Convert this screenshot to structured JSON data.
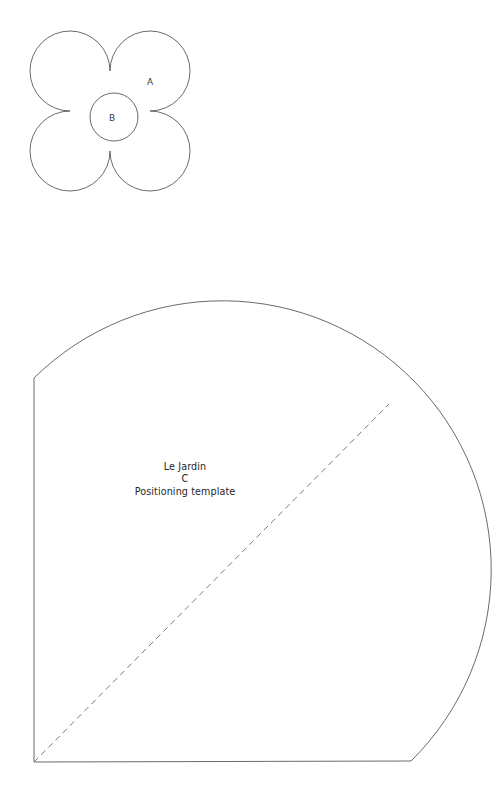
{
  "document": {
    "kind": "sewing-pattern-template",
    "background_color": "#ffffff",
    "line_color": "#595959",
    "dashed_line_color": "#6a6a6a",
    "text_color": "#262626",
    "width": 498,
    "height": 798
  },
  "flower_piece": {
    "name": "quatrefoil-flower-piece",
    "outer_label": "A",
    "inner_label": "B",
    "bounds": {
      "x": 28,
      "y": 33,
      "width": 164,
      "height": 157
    },
    "inner_circle": {
      "cx": 114,
      "cy": 117,
      "r": 24
    }
  },
  "template_piece": {
    "name": "positioning-template-piece",
    "caption": {
      "line1": "Le Jardin",
      "line2": "C",
      "line3": "Positioning template"
    },
    "caption_position": {
      "x": 185,
      "y": 461
    },
    "corner_bottom_left": {
      "x": 34,
      "y": 762
    },
    "corner_bottom_right": {
      "x": 411,
      "y": 761
    },
    "corner_top_left": {
      "x": 34,
      "y": 378
    },
    "arc_top": {
      "x": 215,
      "y": 320
    },
    "arc_right": {
      "x": 472,
      "y": 566
    },
    "diagonal_guide": {
      "label": "dashed-diagonal-guide",
      "from": {
        "x": 34,
        "y": 762
      },
      "to": {
        "x": 389,
        "y": 404
      },
      "dash_pattern": "6 4.2"
    }
  }
}
